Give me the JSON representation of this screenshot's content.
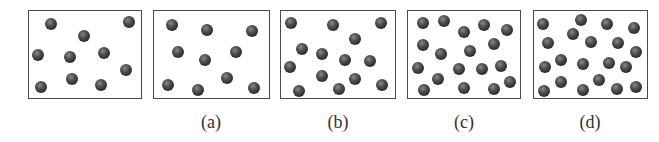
{
  "figure": {
    "panels": [
      {
        "id": "reference",
        "label": "",
        "box": {
          "x": 28,
          "y": 10,
          "w": 114,
          "h": 89
        },
        "particle_count": 10,
        "particles": [
          [
            51,
            24
          ],
          [
            129,
            22
          ],
          [
            84,
            36
          ],
          [
            38,
            55
          ],
          [
            70,
            57
          ],
          [
            104,
            53
          ],
          [
            126,
            70
          ],
          [
            72,
            79
          ],
          [
            101,
            85
          ],
          [
            41,
            87
          ]
        ]
      },
      {
        "id": "a",
        "label": "(a)",
        "label_pos": {
          "x": 211,
          "y": 112
        },
        "box": {
          "x": 153,
          "y": 10,
          "w": 117,
          "h": 89
        },
        "particle_count": 10,
        "particles": [
          [
            172,
            25
          ],
          [
            207,
            30
          ],
          [
            252,
            31
          ],
          [
            178,
            52
          ],
          [
            205,
            60
          ],
          [
            236,
            52
          ],
          [
            168,
            85
          ],
          [
            198,
            90
          ],
          [
            227,
            78
          ],
          [
            254,
            88
          ]
        ]
      },
      {
        "id": "b",
        "label": "(b)",
        "label_pos": {
          "x": 338,
          "y": 112
        },
        "box": {
          "x": 280,
          "y": 10,
          "w": 116,
          "h": 89
        },
        "particle_count": 14,
        "particles": [
          [
            291,
            23
          ],
          [
            333,
            25
          ],
          [
            381,
            23
          ],
          [
            355,
            39
          ],
          [
            302,
            49
          ],
          [
            322,
            54
          ],
          [
            345,
            60
          ],
          [
            370,
            61
          ],
          [
            290,
            67
          ],
          [
            322,
            76
          ],
          [
            355,
            79
          ],
          [
            382,
            85
          ],
          [
            299,
            91
          ],
          [
            339,
            89
          ]
        ]
      },
      {
        "id": "c",
        "label": "(c)",
        "label_pos": {
          "x": 464,
          "y": 112
        },
        "box": {
          "x": 407,
          "y": 10,
          "w": 114,
          "h": 89
        },
        "particle_count": 18,
        "particles": [
          [
            423,
            23
          ],
          [
            444,
            21
          ],
          [
            464,
            32
          ],
          [
            484,
            25
          ],
          [
            507,
            30
          ],
          [
            423,
            45
          ],
          [
            441,
            54
          ],
          [
            470,
            51
          ],
          [
            494,
            44
          ],
          [
            418,
            68
          ],
          [
            459,
            69
          ],
          [
            482,
            69
          ],
          [
            501,
            66
          ],
          [
            438,
            79
          ],
          [
            424,
            90
          ],
          [
            464,
            88
          ],
          [
            494,
            89
          ],
          [
            510,
            82
          ]
        ]
      },
      {
        "id": "d",
        "label": "(d)",
        "label_pos": {
          "x": 590,
          "y": 112
        },
        "box": {
          "x": 533,
          "y": 10,
          "w": 115,
          "h": 89
        },
        "particle_count": 20,
        "particles": [
          [
            543,
            24
          ],
          [
            581,
            20
          ],
          [
            607,
            24
          ],
          [
            634,
            28
          ],
          [
            573,
            34
          ],
          [
            548,
            43
          ],
          [
            591,
            42
          ],
          [
            618,
            43
          ],
          [
            636,
            52
          ],
          [
            561,
            60
          ],
          [
            545,
            67
          ],
          [
            583,
            64
          ],
          [
            609,
            63
          ],
          [
            626,
            67
          ],
          [
            561,
            82
          ],
          [
            599,
            80
          ],
          [
            544,
            91
          ],
          [
            583,
            90
          ],
          [
            617,
            89
          ],
          [
            636,
            87
          ]
        ]
      }
    ],
    "colors": {
      "border": "#4a4a4a",
      "particle": "#2e2e2e",
      "label": "#333333",
      "background": "#ffffff"
    }
  }
}
